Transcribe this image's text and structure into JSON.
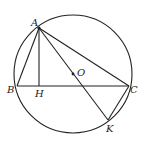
{
  "diagram": {
    "type": "geometry",
    "circle": {
      "center": "O",
      "cx": 73,
      "cy": 74,
      "r": 59
    },
    "points": {
      "A": {
        "label": "A",
        "x": 39,
        "y": 28,
        "lx": 31,
        "ly": 26
      },
      "B": {
        "label": "B",
        "x": 17,
        "y": 86,
        "lx": 7,
        "ly": 93
      },
      "H": {
        "label": "H",
        "x": 39,
        "y": 86,
        "lx": 35,
        "ly": 97
      },
      "O": {
        "label": "O",
        "x": 73,
        "y": 74,
        "lx": 77,
        "ly": 76
      },
      "C": {
        "label": "C",
        "x": 129,
        "y": 86,
        "lx": 130,
        "ly": 93
      },
      "K": {
        "label": "K",
        "x": 108,
        "y": 120,
        "lx": 106,
        "ly": 132
      }
    },
    "segments": [
      "AB",
      "AH",
      "AC",
      "AK",
      "BC",
      "CK"
    ],
    "stroke_color": "#222222"
  }
}
